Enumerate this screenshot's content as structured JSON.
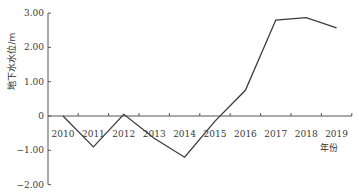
{
  "chart_data": {
    "type": "line",
    "title": "",
    "xlabel": "年份",
    "ylabel": "地下水水位/m",
    "categories": [
      "2010",
      "2011",
      "2012",
      "2013",
      "2014",
      "2015",
      "2016",
      "2017",
      "2018",
      "2019"
    ],
    "series": [
      {
        "name": "地下水水位",
        "values": [
          0.0,
          -0.9,
          0.05,
          -0.65,
          -1.2,
          -0.15,
          0.75,
          2.8,
          2.87,
          2.57
        ]
      }
    ],
    "yticks": [
      "3.00",
      "2.00",
      "1.00",
      "0",
      "-1.00",
      "-2.00"
    ],
    "ytick_values": [
      3,
      2,
      1,
      0,
      -1,
      -2
    ],
    "ylim": [
      -2,
      3
    ],
    "grid": false,
    "legend": "none",
    "line_color": "#3c3c3c"
  }
}
